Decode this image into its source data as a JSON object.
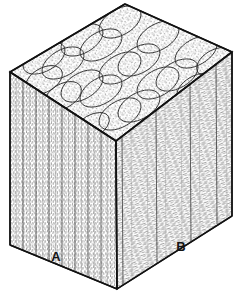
{
  "figure": {
    "type": "scientific-illustration",
    "background_color": "#ffffff",
    "ink_color": "#1a1a1a",
    "stipple_color": "#8c8c8c",
    "hatch_color": "#9a9a9a"
  },
  "block": {
    "projection": "axonometric",
    "vertices": {
      "top_back": {
        "x": 125,
        "y": 4
      },
      "top_left": {
        "x": 10,
        "y": 72
      },
      "top_front": {
        "x": 116,
        "y": 141
      },
      "top_right": {
        "x": 232,
        "y": 52
      },
      "bottom_left": {
        "x": 10,
        "y": 245
      },
      "bottom_front": {
        "x": 117,
        "y": 289
      },
      "bottom_right": {
        "x": 232,
        "y": 216
      }
    },
    "faces": [
      {
        "name": "top-face",
        "label": "Top surface: transverse section showing packed elliptical fiber cross-sections",
        "texture": "stippled ellipse mosaic",
        "ellipse_rows": 5,
        "ellipse_cols": 5
      },
      {
        "name": "left-face",
        "label": "Left face: longitudinal section with vertical stippled fiber columns",
        "texture": "vertical stipple columns",
        "column_count": 8
      },
      {
        "name": "right-face",
        "label": "Right face: longitudinal section with transverse dash hatching",
        "texture": "horizontal dash hatching",
        "column_count": 4
      }
    ]
  },
  "labels": [
    {
      "id": "label-a",
      "text": "A",
      "x": 56,
      "y": 261,
      "refers_to": "left-face"
    },
    {
      "id": "label-b",
      "text": "B",
      "x": 181,
      "y": 251,
      "refers_to": "right-face"
    }
  ],
  "legend": {
    "a_description": "A",
    "b_description": "B"
  }
}
